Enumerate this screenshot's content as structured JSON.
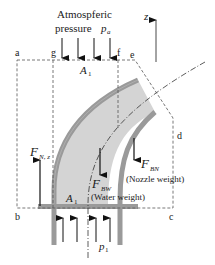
{
  "diagram": {
    "title_line1": "Atmospferic",
    "title_line2": "pressure",
    "pressure_symbol": "p",
    "pressure_sub": "a",
    "axis_label": "z",
    "points": {
      "a": "a",
      "b": "b",
      "c": "c",
      "d": "d",
      "e": "e",
      "f": "f",
      "g": "g"
    },
    "area_top": {
      "sym": "A",
      "sub": "1"
    },
    "area_bottom": {
      "sym": "A",
      "sub": "1"
    },
    "inlet_pressure": {
      "sym": "p",
      "sub": "1"
    },
    "force_reaction": {
      "sym": "F",
      "sub": "N, z"
    },
    "force_water": {
      "sym": "F",
      "sub": "BW",
      "note": "(Water weight)"
    },
    "force_nozzle": {
      "sym": "F",
      "sub": "BN",
      "note": "(Nozzle weight)"
    },
    "colors": {
      "pipe_wall": "#9a9a9a",
      "pipe_fill": "#d4d4d4",
      "lines": "#222222",
      "dashed": "#555555"
    }
  }
}
